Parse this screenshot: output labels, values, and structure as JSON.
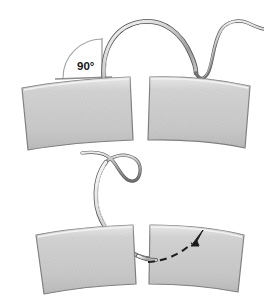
{
  "figure": {
    "background_color": "#ffffff",
    "width": 264,
    "height": 301
  },
  "annotations": {
    "angle_label": "90°",
    "angle_label_color": "#151515",
    "angle_arc_color": "#9a9a9a",
    "vertical_reference_line_color": "#8d8d8d",
    "horizontal_reference_line_color": "#8d8d8d"
  },
  "panels": [
    {
      "id": "top-panel",
      "name": "needle-entry-panel",
      "description": "Curved suture needle held perpendicular (90 degrees) to the tissue surface at the wound edge",
      "tissue_fill": "#c9c9c9",
      "tissue_edge_color": "#7d7d7d",
      "tissue_highlight": "#e8e8e8",
      "flaps": 2
    },
    {
      "id": "bottom-panel",
      "name": "needle-rotation-panel",
      "description": "Needle passed through tissue with dashed curved arrow indicating wrist rotation direction",
      "tissue_fill": "#c9c9c9",
      "tissue_edge_color": "#7d7d7d",
      "tissue_highlight": "#e8e8e8",
      "flaps": 2,
      "arrow_color": "#1b1b1b",
      "arrow_style": "dashed-curved"
    }
  ],
  "needle": {
    "name": "curved-suture-needle",
    "body_color": "#d3d3d3",
    "outline_color": "#555555",
    "highlight_color": "#f2f2f2"
  },
  "suture_thread": {
    "name": "suture-thread",
    "color": "#8e8e8e",
    "outline_color": "#5a5a5a",
    "description": "Thread trailing from needle swage, curving off the upper right edge"
  }
}
